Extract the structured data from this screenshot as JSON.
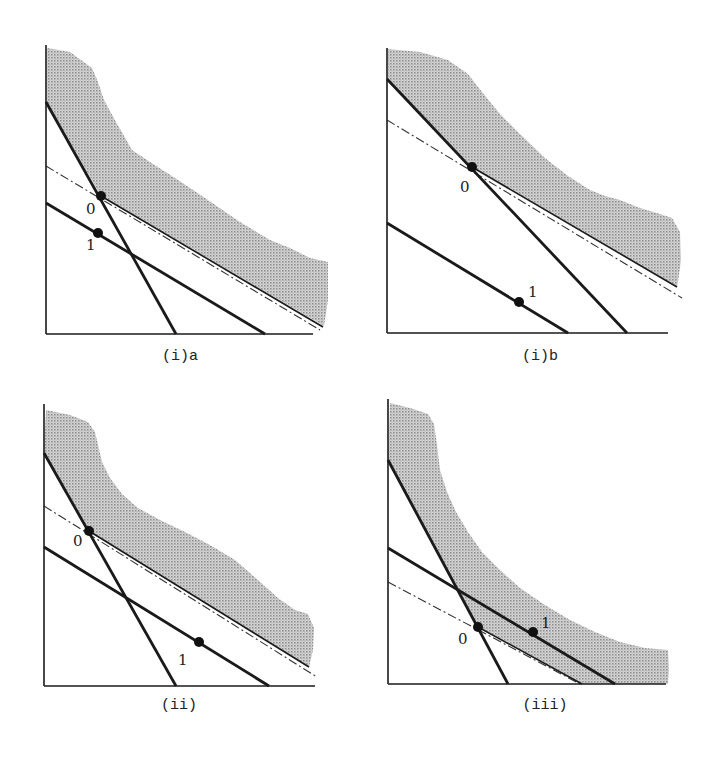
{
  "figure": {
    "colors": {
      "ink": "#1a1a1a",
      "shade": "#b8b8b8",
      "background": "#ffffff"
    }
  },
  "panels": [
    {
      "id": "ia",
      "caption": "(i)a",
      "point_0_label": "0",
      "point_1_label": "1"
    },
    {
      "id": "ib",
      "caption": "(i)b",
      "point_0_label": "0",
      "point_1_label": "1"
    },
    {
      "id": "ii",
      "caption": "(ii)",
      "point_0_label": "0",
      "point_1_label": "1"
    },
    {
      "id": "iii",
      "caption": "(iii)",
      "point_0_label": "0",
      "point_1_label": "1"
    }
  ]
}
